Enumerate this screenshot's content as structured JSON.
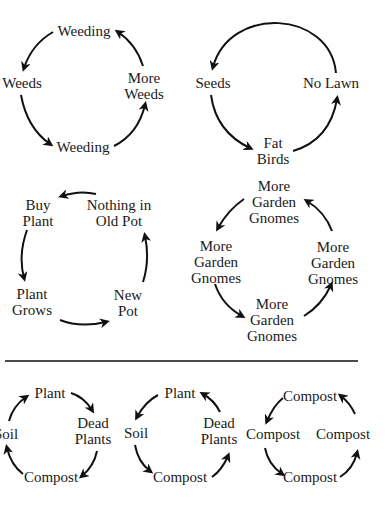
{
  "diagrams": {
    "weeds": {
      "nodes": [
        "Weeding",
        "Weeds",
        "Weeding",
        "More\nWeeds"
      ]
    },
    "lawn": {
      "nodes": [
        "Seeds",
        "Fat\nBirds",
        "No Lawn"
      ]
    },
    "pot": {
      "nodes": [
        "Buy\nPlant",
        "Plant\nGrows",
        "New\nPot",
        "Nothing in\nOld Pot"
      ]
    },
    "gnomes": {
      "nodes": [
        "More\nGarden\nGnomes",
        "More\nGarden\nGnomes",
        "More\nGarden\nGnomes",
        "More\nGarden\nGnomes"
      ]
    },
    "compost_cycle_a": {
      "nodes": [
        "Plant",
        "Dead\nPlants",
        "Compost",
        "Soil"
      ]
    },
    "compost_cycle_b": {
      "nodes": [
        "Plant",
        "Soil",
        "Compost",
        "Dead\nPlants"
      ]
    },
    "compost_cycle_c": {
      "nodes": [
        "Compost",
        "Compost",
        "Compost",
        "Compost"
      ]
    }
  },
  "colors": {
    "ink": "#111111",
    "background": "#ffffff"
  }
}
